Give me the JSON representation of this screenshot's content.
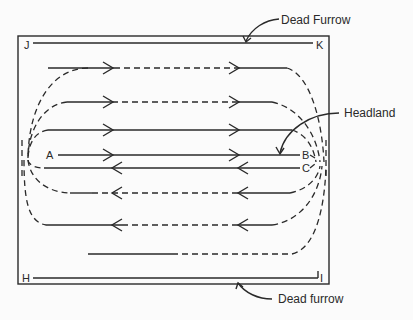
{
  "diagram": {
    "labels": {
      "dead_furrow_top": "Dead Furrow",
      "dead_furrow_bottom": "Dead furrow",
      "headland": "Headland"
    },
    "corner_points": {
      "J": "J",
      "K": "K",
      "H": "H",
      "I": "I"
    },
    "field_points": {
      "A": "A",
      "B": "B",
      "C": "C"
    },
    "colors": {
      "line": "#2a2a2a",
      "background": "#fbfbfb"
    },
    "passes": [
      {
        "row": 1,
        "direction": "right",
        "style": "solid-dashed"
      },
      {
        "row": 2,
        "direction": "right",
        "style": "solid-dashed"
      },
      {
        "row": 3,
        "direction": "right",
        "style": "solid"
      },
      {
        "row": 4,
        "direction": "right",
        "style": "solid",
        "from": "A",
        "to": "B"
      },
      {
        "row": 5,
        "direction": "left",
        "style": "solid",
        "from": "C"
      },
      {
        "row": 6,
        "direction": "left",
        "style": "solid-dashed"
      },
      {
        "row": 7,
        "direction": "left",
        "style": "solid-dashed"
      },
      {
        "row": 8,
        "direction": "none",
        "style": "solid-dashed"
      }
    ]
  }
}
